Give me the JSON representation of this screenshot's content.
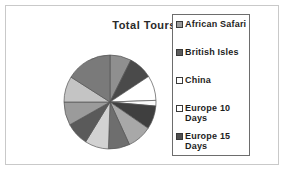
{
  "chart_data": {
    "type": "pie",
    "title": "Total Tours",
    "xlabel": "",
    "ylabel": "",
    "legend_position": "right",
    "grid": false,
    "categories": [
      "African Safari",
      "British Isles",
      "China",
      "Europe 10 Days",
      "Europe 15 Days",
      "Slice 6",
      "Slice 7",
      "Slice 8",
      "Slice 9",
      "Slice 10",
      "Slice 11",
      "Slice 12"
    ],
    "values": [
      9,
      9,
      8,
      8,
      9,
      8,
      8,
      9,
      8,
      8,
      8,
      8
    ],
    "slice_colors": [
      "#8f8f8f",
      "#4a4a4a",
      "#ffffff",
      "#fbfbfb",
      "#3f3f3f",
      "#a8a8a8",
      "#6e6e6e",
      "#d2d2d2",
      "#5a5a5a",
      "#9b9b9b",
      "#c4c4c4",
      "#7a7a7a"
    ],
    "slice_angles_deg": [
      [
        0,
        27
      ],
      [
        27,
        57
      ],
      [
        57,
        88
      ],
      [
        88,
        95
      ],
      [
        95,
        124
      ],
      [
        124,
        155
      ],
      [
        155,
        182
      ],
      [
        182,
        212
      ],
      [
        212,
        241
      ],
      [
        241,
        270
      ],
      [
        270,
        302
      ],
      [
        302,
        360
      ]
    ]
  },
  "legend": {
    "items": [
      {
        "label": "African Safari",
        "swatch_color": "#9a9a9a"
      },
      {
        "label": "British Isles",
        "swatch_color": "#5c5c5c"
      },
      {
        "label": "China",
        "swatch_color": "#ffffff"
      },
      {
        "label": "Europe 10 Days",
        "swatch_color": "#ffffff"
      },
      {
        "label": "Europe 15 Days",
        "swatch_color": "#4f4f4f"
      }
    ]
  },
  "style": {
    "frame_border": "#c9c9c9",
    "legend_border": "#6d6d6d",
    "text_color": "#1d1d1d",
    "pie_outline": "#555555"
  }
}
